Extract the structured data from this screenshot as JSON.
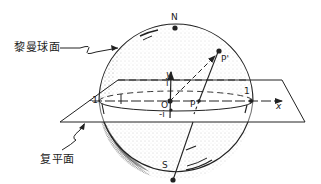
{
  "diagram": {
    "labels": {
      "sphere": "黎曼球面",
      "plane": "复平面",
      "north_pole": "N",
      "south_pole": "S",
      "origin": "O",
      "point_p": "P",
      "point_p_prime": "P'",
      "x_axis": "x",
      "y_axis": "y",
      "plus_one": "1",
      "minus_one": "-1",
      "plus_i": "i",
      "minus_i": "-i"
    },
    "colors": {
      "ink": "#222222",
      "background": "#ffffff",
      "shade": "#555555"
    }
  }
}
